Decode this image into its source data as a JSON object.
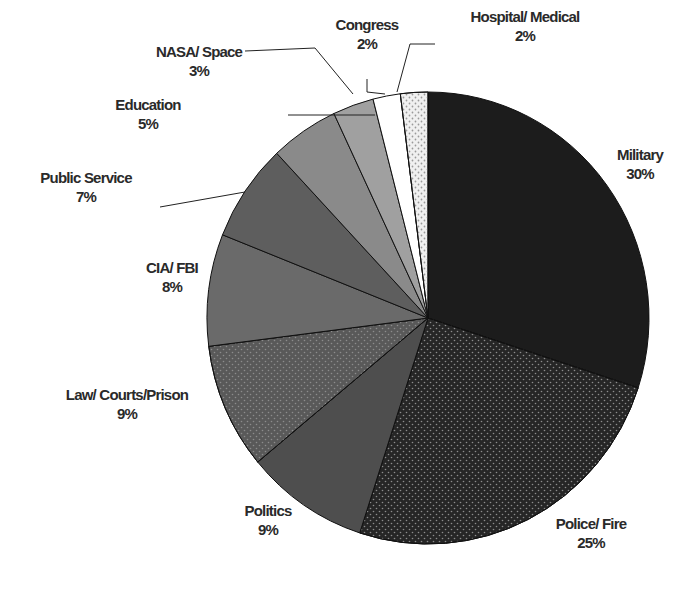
{
  "chart_data": {
    "type": "pie",
    "title": "",
    "start_angle_deg": 0,
    "direction": "clockwise",
    "slices": [
      {
        "label": "Military",
        "value": 30,
        "pct": "30%",
        "color": "#1c1c1c",
        "pattern": "none"
      },
      {
        "label": "Police/ Fire",
        "value": 25,
        "pct": "25%",
        "color": "#262626",
        "pattern": "dots"
      },
      {
        "label": "Politics",
        "value": 9,
        "pct": "9%",
        "color": "#4e4e4e",
        "pattern": "none"
      },
      {
        "label": "Law/ Courts/Prison",
        "value": 9,
        "pct": "9%",
        "color": "#595959",
        "pattern": "dots"
      },
      {
        "label": "CIA/ FBI",
        "value": 8,
        "pct": "8%",
        "color": "#6a6a6a",
        "pattern": "none"
      },
      {
        "label": "Public Service",
        "value": 7,
        "pct": "7%",
        "color": "#5e5e5e",
        "pattern": "none"
      },
      {
        "label": "Education",
        "value": 5,
        "pct": "5%",
        "color": "#8a8a8a",
        "pattern": "none"
      },
      {
        "label": "NASA/ Space",
        "value": 3,
        "pct": "3%",
        "color": "#a0a0a0",
        "pattern": "none"
      },
      {
        "label": "Congress",
        "value": 2,
        "pct": "2%",
        "color": "#ffffff",
        "pattern": "none"
      },
      {
        "label": "Hospital/ Medical",
        "value": 2,
        "pct": "2%",
        "color": "#f0f0f0",
        "pattern": "dots"
      }
    ],
    "legend": "none",
    "data_labels": "category and percent"
  },
  "labels": [
    {
      "name": "Military",
      "pct": "30%",
      "x": 640,
      "y": 164
    },
    {
      "name": "Police/ Fire",
      "pct": "25%",
      "x": 591,
      "y": 533
    },
    {
      "name": "Politics",
      "pct": "9%",
      "x": 268,
      "y": 520
    },
    {
      "name": "Law/ Courts/Prison",
      "pct": "9%",
      "x": 127,
      "y": 404
    },
    {
      "name": "CIA/ FBI",
      "pct": "8%",
      "x": 172,
      "y": 277
    },
    {
      "name": "Public Service",
      "pct": "7%",
      "x": 86,
      "y": 187
    },
    {
      "name": "Education",
      "pct": "5%",
      "x": 148,
      "y": 114
    },
    {
      "name": "NASA/ Space",
      "pct": "3%",
      "x": 199,
      "y": 61
    },
    {
      "name": "Congress",
      "pct": "2%",
      "x": 367,
      "y": 34
    },
    {
      "name": "Hospital/ Medical",
      "pct": "2%",
      "x": 525,
      "y": 26
    }
  ],
  "leaders": [
    {
      "points": "288,115 375,115"
    },
    {
      "points": "160,207 245,192"
    },
    {
      "points": "245,51 315,48 353,94"
    },
    {
      "points": "367,79 367,92 385,94"
    },
    {
      "points": "435,44 410,44 397,92"
    }
  ]
}
